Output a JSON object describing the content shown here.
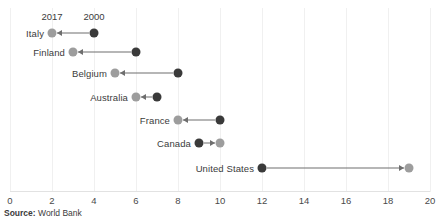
{
  "chart_data": {
    "type": "scatter",
    "subtype": "dumbbell-arrow",
    "title": "",
    "xlabel": "",
    "ylabel": "",
    "xlim": [
      0,
      20
    ],
    "xticks": [
      0,
      2,
      4,
      6,
      8,
      10,
      12,
      14,
      16,
      18,
      20
    ],
    "xtick_labels": [
      "0",
      "2",
      "4",
      "6",
      "8",
      "10",
      "12",
      "14",
      "16",
      "18",
      "20"
    ],
    "grid": "vertical-only",
    "legend_position": "inline-annotation",
    "series": [
      {
        "name": "2000",
        "color": "#3a3a3a",
        "values": [
          4,
          6,
          8,
          7,
          10,
          9,
          12
        ]
      },
      {
        "name": "2017",
        "color": "#9d9d9d",
        "values": [
          2,
          3,
          5,
          6,
          8,
          10,
          19
        ]
      }
    ],
    "categories": [
      "Italy",
      "Finland",
      "Belgium",
      "Australia",
      "France",
      "Canada",
      "United States"
    ],
    "rows": [
      {
        "label": "Italy",
        "start_year": "2000",
        "start_value": 4,
        "end_year": "2017",
        "end_value": 2,
        "direction": "left"
      },
      {
        "label": "Finland",
        "start_year": "2000",
        "start_value": 6,
        "end_year": "2017",
        "end_value": 3,
        "direction": "left"
      },
      {
        "label": "Belgium",
        "start_year": "2000",
        "start_value": 8,
        "end_year": "2017",
        "end_value": 5,
        "direction": "left"
      },
      {
        "label": "Australia",
        "start_year": "2000",
        "start_value": 7,
        "end_year": "2017",
        "end_value": 6,
        "direction": "left"
      },
      {
        "label": "France",
        "start_year": "2000",
        "start_value": 10,
        "end_year": "2017",
        "end_value": 8,
        "direction": "left"
      },
      {
        "label": "Canada",
        "start_year": "2000",
        "start_value": 9,
        "end_year": "2017",
        "end_value": 10,
        "direction": "right"
      },
      {
        "label": "United States",
        "start_year": "2000",
        "start_value": 12,
        "end_year": "2017",
        "end_value": 19,
        "direction": "right"
      }
    ],
    "annotations": [
      {
        "text": "2017",
        "at_value": 2,
        "row": "Italy"
      },
      {
        "text": "2000",
        "at_value": 4,
        "row": "Italy"
      }
    ]
  },
  "source": {
    "key": "Source:",
    "value": " World Bank"
  },
  "colors": {
    "start_dot": "#3a3a3a",
    "end_dot": "#9d9d9d",
    "connector": "#6e6e6e",
    "gridline": "#f0f0f0",
    "axis": "#e2e2e2",
    "text": "#3b3b3b"
  }
}
